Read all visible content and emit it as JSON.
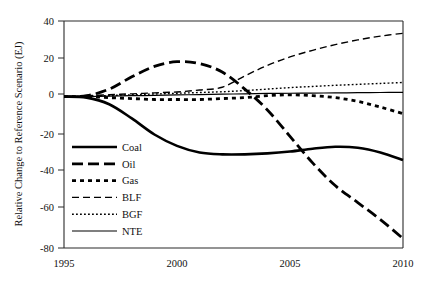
{
  "chart_data": {
    "type": "line",
    "title": "",
    "xlabel": "",
    "ylabel": "Relative Change to Reference Scenario (EJ)",
    "xlim": [
      1995,
      2010
    ],
    "ylim": [
      -80,
      40
    ],
    "xticks": [
      1995,
      2000,
      2005,
      2010
    ],
    "yticks": [
      40,
      20,
      0,
      -20,
      -40,
      -60,
      -80
    ],
    "grid": false,
    "legend_position": "lower-left-inside",
    "x": [
      1995,
      1996,
      1997,
      1998,
      1999,
      2000,
      2001,
      2002,
      2003,
      2004,
      2005,
      2006,
      2007,
      2008,
      2009,
      2010
    ],
    "series": [
      {
        "name": "Coal",
        "style": "thick-solid",
        "values": [
          0,
          -0.5,
          -4,
          -11.5,
          -20,
          -26,
          -29.5,
          -30.5,
          -30.5,
          -30,
          -29,
          -27.5,
          -26.5,
          -27,
          -29.5,
          -33.5
        ]
      },
      {
        "name": "Oil",
        "style": "thick-long-dash",
        "values": [
          0,
          0.5,
          4,
          10.5,
          16,
          18.5,
          17.5,
          13,
          4,
          -7,
          -21,
          -35,
          -47,
          -56,
          -65,
          -75
        ]
      },
      {
        "name": "Gas",
        "style": "thick-square-dot",
        "values": [
          0,
          0,
          -0.5,
          -1,
          -1.5,
          -1.5,
          -1.5,
          -1,
          -0.5,
          0.5,
          1,
          0.5,
          -0.5,
          -2.5,
          -5.5,
          -9
        ]
      },
      {
        "name": "BLF",
        "style": "thin-dash",
        "values": [
          0,
          0.5,
          1,
          1.5,
          2,
          2.5,
          3.5,
          5,
          11,
          16.5,
          21,
          24.5,
          27.5,
          30,
          32,
          33.5
        ]
      },
      {
        "name": "BGF",
        "style": "thin-dot",
        "values": [
          0,
          0.2,
          0.6,
          1,
          1.4,
          1.8,
          2.2,
          2.6,
          3.2,
          4,
          4.8,
          5.4,
          6,
          6.5,
          7,
          7.5
        ]
      },
      {
        "name": "NTE",
        "style": "thin-solid",
        "values": [
          0,
          0.1,
          0.3,
          0.5,
          0.7,
          0.9,
          1.1,
          1.3,
          1.5,
          1.7,
          1.8,
          1.9,
          2.0,
          2.1,
          2.2,
          2.3
        ]
      }
    ]
  },
  "axes": {
    "y_title": "Relative Change to Reference Scenario (EJ)",
    "y_tick_labels": [
      "40",
      "20",
      "0",
      "-20",
      "-40",
      "-60",
      "-80"
    ],
    "x_tick_labels": [
      "1995",
      "2000",
      "2005",
      "2010"
    ]
  },
  "legend": {
    "items": [
      {
        "label": "Coal"
      },
      {
        "label": "Oil"
      },
      {
        "label": "Gas"
      },
      {
        "label": "BLF"
      },
      {
        "label": "BGF"
      },
      {
        "label": "NTE"
      }
    ]
  },
  "colors": {
    "line": "#000000",
    "axis": "#2b2b2b",
    "background": "#ffffff"
  }
}
